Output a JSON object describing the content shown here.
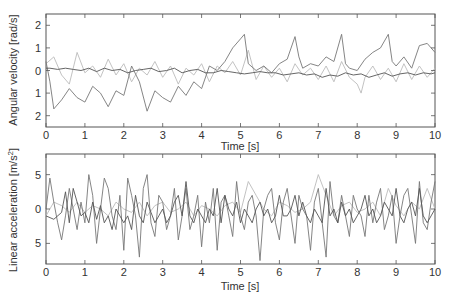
{
  "chart_data": [
    {
      "type": "line",
      "title": "",
      "xlabel": "Time [s]",
      "ylabel": "Angular velocity [rad/s]",
      "xlim": [
        0,
        10
      ],
      "ylim": [
        -2.5,
        2.5
      ],
      "xticks": [
        "0",
        "1",
        "2",
        "3",
        "4",
        "5",
        "6",
        "7",
        "8",
        "9",
        "10"
      ],
      "yticks": [
        "2",
        "1",
        "0",
        "1",
        "2"
      ],
      "ytick_values": [
        2,
        1,
        0,
        -1,
        -2
      ],
      "grid": false,
      "legend": "none",
      "series": [
        {
          "name": "series-1-dark",
          "color": "#555555",
          "x": [
            0,
            0.1,
            0.3,
            0.5,
            0.7,
            0.9,
            1.1,
            1.3,
            1.5,
            1.7,
            1.9,
            2.1,
            2.3,
            2.5,
            2.7,
            2.9,
            3.1,
            3.3,
            3.5,
            3.7,
            3.9,
            4.1,
            4.3,
            4.5,
            4.7,
            4.9,
            5.1,
            5.3,
            5.5,
            5.7,
            5.9,
            6.1,
            6.3,
            6.5,
            6.7,
            6.9,
            7.1,
            7.3,
            7.5,
            7.7,
            7.9,
            8.1,
            8.3,
            8.5,
            8.7,
            8.9,
            9.1,
            9.3,
            9.5,
            9.7,
            9.9,
            10
          ],
          "values": [
            0.1,
            0.1,
            0.05,
            0.1,
            0.05,
            0.0,
            0.1,
            -0.05,
            0.1,
            0.0,
            0.05,
            -0.1,
            0.0,
            0.05,
            0.1,
            -0.05,
            0.0,
            0.1,
            -0.1,
            0.0,
            0.05,
            -0.1,
            -0.1,
            0.0,
            -0.05,
            -0.1,
            -0.15,
            -0.1,
            -0.05,
            -0.1,
            -0.1,
            -0.2,
            -0.15,
            -0.1,
            -0.2,
            -0.15,
            -0.3,
            -0.2,
            -0.25,
            -0.1,
            -0.2,
            -0.15,
            -0.3,
            -0.2,
            -0.1,
            -0.25,
            -0.15,
            -0.1,
            -0.2,
            -0.1,
            -0.15,
            -0.1
          ]
        },
        {
          "name": "series-2-medium",
          "color": "#777777",
          "x": [
            0,
            0.1,
            0.2,
            0.4,
            0.6,
            0.8,
            1.0,
            1.2,
            1.4,
            1.6,
            1.8,
            2.0,
            2.2,
            2.4,
            2.6,
            2.8,
            3.0,
            3.2,
            3.4,
            3.6,
            3.8,
            4.0,
            4.2,
            4.4,
            4.6,
            4.8,
            5.0,
            5.1,
            5.2,
            5.4,
            5.6,
            5.8,
            6.0,
            6.2,
            6.4,
            6.5,
            6.6,
            6.8,
            7.0,
            7.2,
            7.4,
            7.6,
            7.7,
            7.8,
            8.0,
            8.2,
            8.4,
            8.6,
            8.8,
            8.9,
            9.0,
            9.2,
            9.4,
            9.6,
            9.8,
            10
          ],
          "values": [
            0.4,
            -0.5,
            -1.7,
            -1.3,
            -0.8,
            -1.2,
            -1.4,
            -0.7,
            -1.0,
            -1.6,
            -0.9,
            -1.1,
            0.2,
            -0.5,
            -1.8,
            -0.9,
            -1.2,
            -1.4,
            -0.7,
            -1.1,
            -0.5,
            -0.8,
            0.2,
            0.0,
            0.4,
            1.0,
            1.4,
            1.6,
            0.3,
            0.0,
            0.2,
            -0.1,
            0.3,
            0.5,
            1.5,
            0.6,
            0.1,
            0.3,
            0.2,
            0.6,
            0.4,
            1.6,
            0.3,
            0.1,
            0.0,
            0.5,
            0.8,
            1.0,
            1.6,
            0.4,
            0.2,
            0.6,
            0.1,
            1.1,
            1.2,
            0.8
          ]
        },
        {
          "name": "series-3-light",
          "color": "#bbbbbb",
          "x": [
            0,
            0.2,
            0.4,
            0.6,
            0.8,
            1.0,
            1.2,
            1.4,
            1.6,
            1.8,
            2.0,
            2.2,
            2.4,
            2.6,
            2.8,
            3.0,
            3.2,
            3.4,
            3.6,
            3.8,
            4.0,
            4.2,
            4.4,
            4.6,
            4.8,
            5.0,
            5.2,
            5.4,
            5.6,
            5.8,
            6.0,
            6.2,
            6.4,
            6.6,
            6.8,
            7.0,
            7.2,
            7.4,
            7.6,
            7.8,
            8.0,
            8.1,
            8.2,
            8.4,
            8.6,
            8.8,
            9.0,
            9.2,
            9.4,
            9.6,
            9.8,
            10
          ],
          "values": [
            0.3,
            0.6,
            -0.2,
            -0.6,
            0.8,
            -0.1,
            0.2,
            -0.3,
            0.5,
            -0.2,
            0.3,
            -0.5,
            0.1,
            -0.2,
            0.4,
            -0.3,
            0.2,
            -0.6,
            0.1,
            -0.2,
            0.3,
            -0.5,
            0.2,
            -0.1,
            0.4,
            -0.2,
            0.9,
            -0.4,
            0.2,
            -0.3,
            0.1,
            -0.5,
            0.3,
            -0.2,
            0.1,
            -0.4,
            0.2,
            -0.5,
            0.4,
            -0.3,
            -0.6,
            -1.0,
            -0.3,
            0.2,
            -0.4,
            0.1,
            -0.5,
            0.3,
            -0.4,
            0.2,
            -0.3,
            0.1
          ]
        }
      ]
    },
    {
      "type": "line",
      "title": "",
      "xlabel": "Time [s]",
      "ylabel": "Linear acceleration [m/s²]",
      "xlim": [
        0,
        10
      ],
      "ylim": [
        -8,
        8
      ],
      "xticks": [
        "0",
        "1",
        "2",
        "3",
        "4",
        "5",
        "6",
        "7",
        "8",
        "9",
        "10"
      ],
      "yticks": [
        "5",
        "0",
        "5"
      ],
      "ytick_values": [
        5,
        0,
        -5
      ],
      "grid": false,
      "legend": "none",
      "series": [
        {
          "name": "series-1-dark",
          "color": "#555555",
          "x": [
            0,
            0.2,
            0.4,
            0.5,
            0.6,
            0.7,
            0.8,
            0.9,
            1.0,
            1.1,
            1.2,
            1.3,
            1.4,
            1.5,
            1.6,
            1.7,
            1.8,
            1.9,
            2.0,
            2.1,
            2.2,
            2.3,
            2.4,
            2.5,
            2.6,
            2.7,
            2.8,
            2.9,
            3.0,
            3.1,
            3.2,
            3.3,
            3.4,
            3.5,
            3.6,
            3.7,
            3.8,
            3.9,
            4.0,
            4.1,
            4.2,
            4.3,
            4.4,
            4.5,
            4.6,
            4.7,
            4.8,
            4.9,
            5.0,
            5.1,
            5.2,
            5.3,
            5.4,
            5.5,
            5.6,
            5.7,
            5.8,
            5.9,
            6.0,
            6.1,
            6.2,
            6.3,
            6.4,
            6.5,
            6.6,
            6.7,
            6.8,
            6.9,
            7.0,
            7.1,
            7.2,
            7.3,
            7.4,
            7.5,
            7.6,
            7.7,
            7.8,
            7.9,
            8.0,
            8.1,
            8.2,
            8.3,
            8.4,
            8.5,
            8.6,
            8.7,
            8.8,
            8.9,
            9.0,
            9.1,
            9.2,
            9.3,
            9.4,
            9.5,
            9.6,
            9.7,
            9.8,
            9.9,
            10
          ],
          "values": [
            -1,
            -1.5,
            -0.5,
            2.5,
            -2,
            3,
            1,
            -1,
            -0.5,
            -2,
            1,
            -1.5,
            0.5,
            -2,
            -1,
            -3,
            0,
            -1,
            -2,
            -1,
            -3,
            2,
            -1,
            -2,
            1,
            -0.5,
            -2,
            -1,
            0,
            -2,
            -1,
            1,
            2,
            -1,
            4,
            -1,
            -2,
            0,
            -1,
            -2,
            0,
            -1,
            3,
            -2,
            2,
            0,
            -1,
            1,
            -2,
            0,
            -1,
            -2,
            0,
            1,
            -1,
            0,
            -2,
            -1,
            2,
            -1,
            -1,
            0,
            2,
            -1,
            1,
            -1,
            -2,
            0,
            -1,
            -2,
            3,
            -1,
            0,
            -2,
            1,
            -1,
            0,
            -2,
            -1,
            0,
            2,
            -1,
            0,
            -2,
            -1,
            1,
            0,
            -1,
            3,
            -1,
            -2,
            0,
            1,
            -1,
            3,
            -1,
            -2,
            -1,
            0
          ]
        },
        {
          "name": "series-2-medium",
          "color": "#777777",
          "x": [
            0,
            0.1,
            0.2,
            0.3,
            0.4,
            0.5,
            0.6,
            0.7,
            0.8,
            0.9,
            1.0,
            1.1,
            1.2,
            1.3,
            1.4,
            1.5,
            1.6,
            1.7,
            1.8,
            1.9,
            2.0,
            2.1,
            2.2,
            2.3,
            2.4,
            2.5,
            2.6,
            2.7,
            2.8,
            2.9,
            3.0,
            3.1,
            3.2,
            3.3,
            3.4,
            3.5,
            3.6,
            3.7,
            3.8,
            3.9,
            4.0,
            4.1,
            4.2,
            4.3,
            4.4,
            4.5,
            4.6,
            4.7,
            4.8,
            4.9,
            5.0,
            5.1,
            5.2,
            5.3,
            5.4,
            5.5,
            5.6,
            5.7,
            5.8,
            5.9,
            6.0,
            6.1,
            6.2,
            6.3,
            6.4,
            6.5,
            6.6,
            6.7,
            6.8,
            6.9,
            7.0,
            7.1,
            7.2,
            7.3,
            7.4,
            7.5,
            7.6,
            7.7,
            7.8,
            7.9,
            8.0,
            8.1,
            8.2,
            8.3,
            8.4,
            8.5,
            8.6,
            8.7,
            8.8,
            8.9,
            9.0,
            9.1,
            9.2,
            9.3,
            9.4,
            9.5,
            9.6,
            9.7,
            9.8,
            9.9,
            10
          ],
          "values": [
            0,
            4.5,
            1,
            -2,
            -4.5,
            -1,
            3,
            0,
            -3,
            1,
            -2,
            5,
            2,
            -5,
            0,
            4.5,
            3,
            -1,
            -3,
            2,
            -6,
            4.5,
            2,
            -1,
            -7,
            3,
            5,
            -2,
            -4,
            2,
            1,
            -3,
            -1,
            3,
            -4.5,
            -1,
            3,
            -3,
            -1,
            2,
            -5.5,
            1,
            -2,
            3,
            -6,
            1,
            2,
            -1,
            -4,
            4,
            -1,
            -3,
            1,
            2,
            -1,
            -7.5,
            0,
            2,
            3,
            -2,
            -4.5,
            1,
            3,
            -1,
            -5,
            2,
            0,
            -1,
            -6,
            1,
            3,
            -2,
            -7,
            4,
            -1,
            -2,
            2,
            -1,
            -4,
            2,
            0,
            -1,
            -4,
            2,
            -2,
            1,
            3,
            -3,
            -1,
            2,
            -5,
            -1,
            2,
            3,
            -1,
            -5,
            4,
            -2,
            -3,
            1,
            4
          ]
        },
        {
          "name": "series-3-light",
          "color": "#bbbbbb",
          "x": [
            0,
            0.2,
            0.4,
            0.6,
            0.8,
            1.0,
            1.2,
            1.4,
            1.6,
            1.8,
            2.0,
            2.2,
            2.4,
            2.6,
            2.8,
            3.0,
            3.2,
            3.4,
            3.6,
            3.8,
            4.0,
            4.2,
            4.4,
            4.6,
            4.8,
            5.0,
            5.2,
            5.4,
            5.6,
            5.8,
            6.0,
            6.2,
            6.4,
            6.6,
            6.8,
            7.0,
            7.2,
            7.4,
            7.6,
            7.8,
            8.0,
            8.2,
            8.4,
            8.6,
            8.8,
            9.0,
            9.2,
            9.4,
            9.6,
            9.8,
            10
          ],
          "values": [
            -1,
            1,
            0.5,
            -0.5,
            1,
            -0.5,
            0.5,
            0,
            -1,
            1,
            0,
            -0.5,
            1,
            -1,
            0.5,
            1,
            -0.5,
            0,
            1,
            -1,
            0.5,
            0,
            -1,
            0.5,
            1,
            -0.5,
            4,
            2,
            0,
            -1,
            1,
            0.5,
            -0.5,
            0,
            1,
            5,
            2,
            -1,
            0.5,
            1,
            -0.5,
            0,
            1,
            -1,
            3,
            0.5,
            -1,
            1,
            0,
            3,
            0
          ]
        }
      ]
    }
  ],
  "top_plot": {
    "ylabel": "Angular velocity [rad/s]",
    "xlabel": "Time [s]",
    "yticks": [
      "2",
      "1",
      "0",
      "1",
      "2"
    ],
    "xticks": [
      "0",
      "1",
      "2",
      "3",
      "4",
      "5",
      "6",
      "7",
      "8",
      "9",
      "10"
    ]
  },
  "bottom_plot": {
    "ylabel_main": "Linear acceleration [m/s",
    "ylabel_sup": "2",
    "ylabel_end": "]",
    "xlabel": "Time [s]",
    "yticks": [
      "5",
      "0",
      "5"
    ],
    "xticks": [
      "0",
      "1",
      "2",
      "3",
      "4",
      "5",
      "6",
      "7",
      "8",
      "9",
      "10"
    ]
  }
}
